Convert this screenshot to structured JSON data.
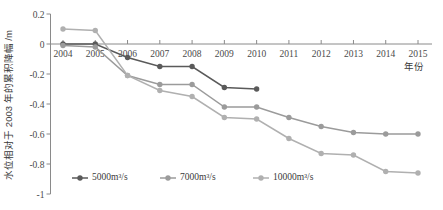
{
  "chart_data": {
    "type": "line",
    "title": "",
    "xlabel": "年份",
    "ylabel": "水位相对于 2003 年的累积降幅 /m",
    "categories": [
      "2004",
      "2005",
      "2006",
      "2007",
      "2008",
      "2009",
      "2010",
      "2011",
      "2012",
      "2013",
      "2014",
      "2015"
    ],
    "x": [
      2004,
      2005,
      2006,
      2007,
      2008,
      2009,
      2010,
      2011,
      2012,
      2013,
      2014,
      2015
    ],
    "xlim": [
      2003.6,
      2015.5
    ],
    "ylim": [
      -1,
      0.2
    ],
    "yticks": [
      0.2,
      0,
      -0.2,
      -0.4,
      -0.6,
      -0.8,
      -1
    ],
    "ytick_labels": [
      "0.2",
      "0",
      "-0.2",
      "-0.4",
      "-0.6",
      "-0.8",
      "-1"
    ],
    "grid": false,
    "legend_position": "bottom",
    "series": [
      {
        "name": "5000m³/s",
        "color": "#5a5a5a",
        "values": [
          0.0,
          0.0,
          -0.09,
          -0.15,
          -0.15,
          -0.29,
          -0.3,
          null,
          null,
          null,
          null,
          null
        ]
      },
      {
        "name": "7000m³/s",
        "color": "#9b9b9b",
        "values": [
          -0.01,
          -0.02,
          -0.21,
          -0.27,
          -0.27,
          -0.42,
          -0.42,
          -0.49,
          -0.55,
          -0.59,
          -0.6,
          -0.6
        ]
      },
      {
        "name": "10000m³/s",
        "color": "#b0b0b0",
        "values": [
          0.1,
          0.09,
          -0.21,
          -0.31,
          -0.35,
          -0.49,
          -0.5,
          -0.63,
          -0.73,
          -0.74,
          -0.85,
          -0.86
        ]
      }
    ]
  },
  "axes": {
    "y_title": "水位相对于 2003 年的累积降幅 /m",
    "x_title": "年份"
  },
  "legend": {
    "items": [
      {
        "label": "5000m³/s",
        "color": "#5a5a5a"
      },
      {
        "label": "7000m³/s",
        "color": "#9b9b9b"
      },
      {
        "label": "10000m³/s",
        "color": "#b0b0b0"
      }
    ]
  }
}
